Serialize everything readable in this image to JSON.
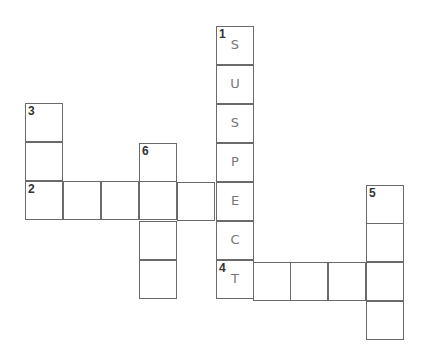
{
  "puzzle": {
    "type": "crossword",
    "cells": [
      {
        "x": 216,
        "y": 26,
        "number": "1",
        "letter": "S"
      },
      {
        "x": 216,
        "y": 65,
        "number": "",
        "letter": "U"
      },
      {
        "x": 216,
        "y": 104,
        "number": "",
        "letter": "S"
      },
      {
        "x": 216,
        "y": 143,
        "number": "",
        "letter": "P"
      },
      {
        "x": 216,
        "y": 182,
        "number": "",
        "letter": "E"
      },
      {
        "x": 216,
        "y": 221,
        "number": "",
        "letter": "C"
      },
      {
        "x": 216,
        "y": 260,
        "number": "4",
        "letter": "T"
      },
      {
        "x": 25,
        "y": 103,
        "number": "3",
        "letter": ""
      },
      {
        "x": 25,
        "y": 142,
        "number": "",
        "letter": ""
      },
      {
        "x": 25,
        "y": 181,
        "number": "2",
        "letter": ""
      },
      {
        "x": 63,
        "y": 181,
        "number": "",
        "letter": ""
      },
      {
        "x": 101,
        "y": 181,
        "number": "",
        "letter": ""
      },
      {
        "x": 139,
        "y": 181,
        "number": "",
        "letter": ""
      },
      {
        "x": 177,
        "y": 182,
        "number": "",
        "letter": ""
      },
      {
        "x": 139,
        "y": 143,
        "number": "6",
        "letter": ""
      },
      {
        "x": 139,
        "y": 221,
        "number": "",
        "letter": ""
      },
      {
        "x": 139,
        "y": 260,
        "number": "",
        "letter": ""
      },
      {
        "x": 253,
        "y": 262,
        "number": "",
        "letter": ""
      },
      {
        "x": 290,
        "y": 262,
        "number": "",
        "letter": ""
      },
      {
        "x": 328,
        "y": 262,
        "number": "",
        "letter": ""
      },
      {
        "x": 366,
        "y": 262,
        "number": "",
        "letter": ""
      },
      {
        "x": 366,
        "y": 185,
        "number": "5",
        "letter": ""
      },
      {
        "x": 366,
        "y": 223,
        "number": "",
        "letter": ""
      },
      {
        "x": 366,
        "y": 301,
        "number": "",
        "letter": ""
      }
    ],
    "answers": {
      "1_down": "SUSPECT"
    }
  }
}
